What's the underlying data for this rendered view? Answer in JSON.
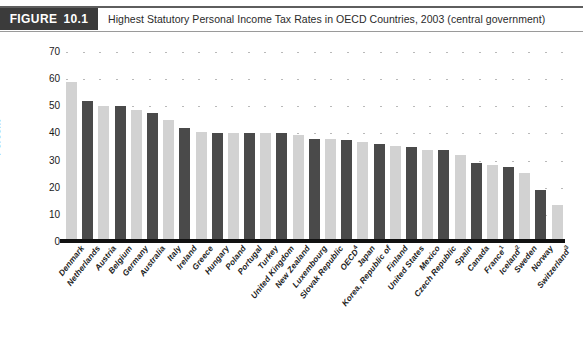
{
  "header": {
    "figure_tag_word": "FIGURE",
    "figure_number": "10.1",
    "title": "Highest Statutory Personal Income Tax Rates in OECD Countries, 2003 (central government)"
  },
  "chart_data": {
    "type": "bar",
    "title": "Highest Statutory Personal Income Tax Rates in OECD Countries, 2003 (central government)",
    "xlabel": "",
    "ylabel": "Percent",
    "ylim": [
      0,
      70
    ],
    "yticks": [
      0,
      10,
      20,
      30,
      40,
      50,
      60,
      70
    ],
    "grid": "dotted",
    "legend": "none",
    "bar_colors": {
      "light": "#d2d2d2",
      "dark": "#4a4a4a"
    },
    "categories": [
      "Denmark",
      "Netherlands",
      "Austria",
      "Belgium",
      "Germany",
      "Australia",
      "Italy",
      "Ireland",
      "Greece",
      "Hungary",
      "Poland",
      "Portugal",
      "Turkey",
      "United Kingdom",
      "New Zealand",
      "Luxembourg",
      "Slovak Republic",
      "OECD",
      "Japan",
      "Korea, Republic of",
      "Finland",
      "United States",
      "Mexico",
      "Czech Republic",
      "Spain",
      "Canada",
      "France",
      "Iceland",
      "Sweden",
      "Norway",
      "Switzerland"
    ],
    "category_footnotes": [
      "",
      "",
      "",
      "",
      "",
      "",
      "",
      "",
      "",
      "",
      "",
      "",
      "",
      "",
      "",
      "",
      "",
      "4",
      "",
      "",
      "",
      "",
      "",
      "",
      "",
      "",
      "1",
      "2",
      "",
      "",
      "3"
    ],
    "values": [
      59,
      52,
      50,
      50,
      48.5,
      47.5,
      45,
      42,
      40.5,
      40,
      40,
      40,
      40,
      40,
      39.5,
      38,
      38,
      37.5,
      37,
      36,
      35.5,
      35,
      34,
      34,
      32,
      29,
      28.5,
      27.5,
      25.5,
      19,
      13.5
    ],
    "shades": [
      "light",
      "dark",
      "light",
      "dark",
      "light",
      "dark",
      "light",
      "dark",
      "light",
      "dark",
      "light",
      "dark",
      "light",
      "dark",
      "light",
      "dark",
      "light",
      "dark",
      "light",
      "dark",
      "light",
      "dark",
      "light",
      "dark",
      "light",
      "dark",
      "light",
      "dark",
      "light",
      "dark",
      "light"
    ]
  }
}
